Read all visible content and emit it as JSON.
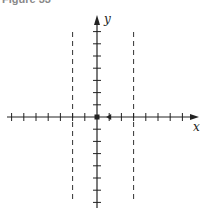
{
  "caption": "Figure 33",
  "axes": {
    "x_label": "x",
    "y_label": "y",
    "origin": [
      97,
      117
    ],
    "tick_spacing_px": 12.2,
    "x_ticks_left": 7,
    "x_ticks_right": 7,
    "y_ticks_up": 7,
    "y_ticks_down": 7
  },
  "asymptotes": {
    "style": "dashed",
    "x_positions_units": [
      -2,
      3
    ]
  },
  "points": [
    {
      "name": "origin",
      "x_units": 0,
      "y_units": 0,
      "style": "filled"
    },
    {
      "name": "marker",
      "x_units": 1,
      "y_units": 0,
      "style": "filled-arrow-left"
    }
  ],
  "colors": {
    "axis": "#222222",
    "dash": "#333333",
    "background": "#ffffff"
  }
}
